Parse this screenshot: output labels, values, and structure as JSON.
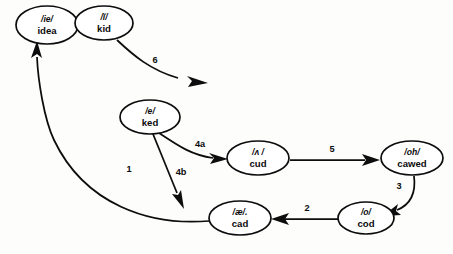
{
  "diagram": {
    "background_color": "#fdfdfc",
    "stroke_color": "#0d0d0d",
    "node_fill": "#ffffff",
    "nodes": [
      {
        "id": "idea",
        "ipa": "/ie/",
        "word": "idea",
        "cx": 47,
        "cy": 25,
        "rx": 31,
        "ry": 19
      },
      {
        "id": "kid",
        "ipa": "/ĭ/",
        "word": "kid",
        "cx": 104,
        "cy": 23,
        "rx": 29,
        "ry": 17
      },
      {
        "id": "ked",
        "ipa": "/e/",
        "word": "ked",
        "cx": 150,
        "cy": 117,
        "rx": 30,
        "ry": 17
      },
      {
        "id": "cud",
        "ipa": "/ʌ /",
        "word": "cud",
        "cx": 258,
        "cy": 158,
        "rx": 31,
        "ry": 17
      },
      {
        "id": "cawed",
        "ipa": "/oh/",
        "word": "cawed",
        "cx": 412,
        "cy": 158,
        "rx": 31,
        "ry": 17
      },
      {
        "id": "cod",
        "ipa": "/o/",
        "word": "cod",
        "cx": 366,
        "cy": 218,
        "rx": 28,
        "ry": 16
      },
      {
        "id": "cad",
        "ipa": "/æ/.",
        "word": "cad",
        "cx": 240,
        "cy": 218,
        "rx": 31,
        "ry": 17
      }
    ],
    "edges": [
      {
        "id": "edge-1",
        "label": "1",
        "from": "cad",
        "to": "idea",
        "label_x": 129,
        "label_y": 172
      },
      {
        "id": "edge-2",
        "label": "2",
        "from": "cod",
        "to": "cad",
        "label_x": 307,
        "label_y": 211
      },
      {
        "id": "edge-3",
        "label": "3",
        "from": "cawed",
        "to": "cod",
        "label_x": 399,
        "label_y": 189
      },
      {
        "id": "edge-4a",
        "label": "4a",
        "from": "ked",
        "to": "cud",
        "label_x": 200,
        "label_y": 147
      },
      {
        "id": "edge-4b",
        "label": "4b",
        "from": "ked",
        "to": "cad",
        "label_x": 181,
        "label_y": 175
      },
      {
        "id": "edge-5",
        "label": "5",
        "from": "cud",
        "to": "cawed",
        "label_x": 332,
        "label_y": 152
      },
      {
        "id": "edge-6",
        "label": "6",
        "from": "kid",
        "to": "open",
        "label_x": 155,
        "label_y": 63
      }
    ]
  }
}
